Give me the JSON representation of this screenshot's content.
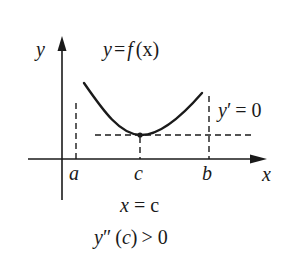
{
  "diagram": {
    "title_formula": {
      "lhs": "y",
      "eq": "=",
      "f": "f",
      "arg": "(x)"
    },
    "axes": {
      "y_label": "y",
      "x_label": "x"
    },
    "points": {
      "a": "a",
      "c": "c",
      "b": "b"
    },
    "derivative_label": {
      "var": "y",
      "prime": "′",
      "eq": "= 0"
    },
    "conditions": {
      "line1_var": "x",
      "line1_rest": "= c",
      "line2_var": "y",
      "line2_primes": "″",
      "line2_arg_open": "(",
      "line2_arg": "c",
      "line2_arg_close": ")",
      "line2_rest": "> 0"
    },
    "colors": {
      "ink": "#1a1a1a",
      "background": "#ffffff"
    }
  }
}
